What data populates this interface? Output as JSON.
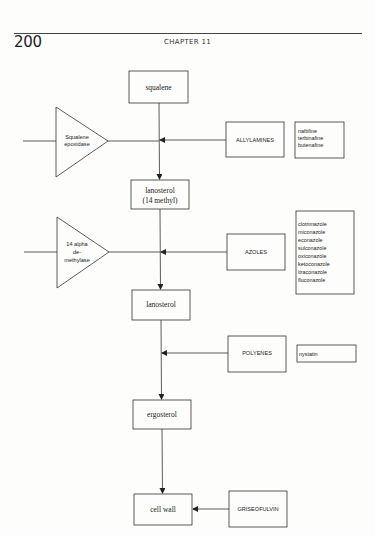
{
  "header": {
    "page_number": "200",
    "chapter": "CHAPTER 11"
  },
  "pathway": {
    "nodes": [
      {
        "id": "squalene",
        "label": "squalene"
      },
      {
        "id": "lanosterol14",
        "label_line1": "lanosterol",
        "label_line2": "(14 methyl)"
      },
      {
        "id": "lanosterol",
        "label": "lanosterol"
      },
      {
        "id": "ergosterol",
        "label": "ergosterol"
      },
      {
        "id": "cellwall",
        "label": "cell wall"
      }
    ],
    "enzymes": [
      {
        "id": "squalene_epoxidase",
        "lines": [
          "Squalene",
          "epoxidase"
        ]
      },
      {
        "id": "demethylase",
        "lines": [
          "14 alpha",
          "de-",
          "methylase"
        ]
      }
    ],
    "drug_classes": [
      {
        "id": "allylamines",
        "label": "ALLYLAMINES",
        "drugs": [
          "naftifine",
          "terbinafine",
          "butenafine"
        ]
      },
      {
        "id": "azoles",
        "label": "AZOLES",
        "drugs": [
          "clotrimazole",
          "miconazole",
          "econazole",
          "sulconazole",
          "oxiconazole",
          "ketoconazole",
          "itraconazole",
          "fluconazole"
        ]
      },
      {
        "id": "polyenes",
        "label": "POLYENES",
        "drugs": [
          "nystatin"
        ]
      },
      {
        "id": "griseofulvin",
        "label": "GRISEOFULVIN",
        "drugs": []
      }
    ]
  }
}
